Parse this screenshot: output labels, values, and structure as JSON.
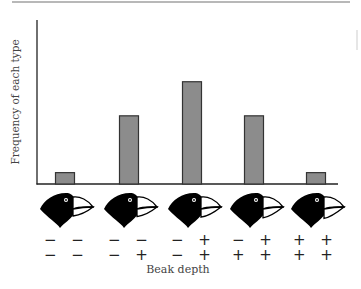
{
  "chart_data": {
    "type": "bar",
    "title": "",
    "xlabel": "Beak depth",
    "ylabel": "Frequency of each type",
    "categories": [
      "− − / − −",
      "− − / − +",
      "− + / − +",
      "− + / + +",
      "+ + / + +"
    ],
    "values": [
      1,
      6,
      9,
      6,
      1
    ],
    "ylim": [
      0,
      14
    ],
    "grid": false,
    "legend": null,
    "bar_color": "#8c8c8c",
    "bar_edge_color": "#333333",
    "genotypes": [
      {
        "top": "− −",
        "bottom": "− −"
      },
      {
        "top": "− −",
        "bottom": "− +"
      },
      {
        "top": "− +",
        "bottom": "− +"
      },
      {
        "top": "− +",
        "bottom": "+ +"
      },
      {
        "top": "+ +",
        "bottom": "+ +"
      }
    ]
  },
  "labels": {
    "y_axis": "Frequency of each type",
    "x_axis": "Beak depth"
  }
}
